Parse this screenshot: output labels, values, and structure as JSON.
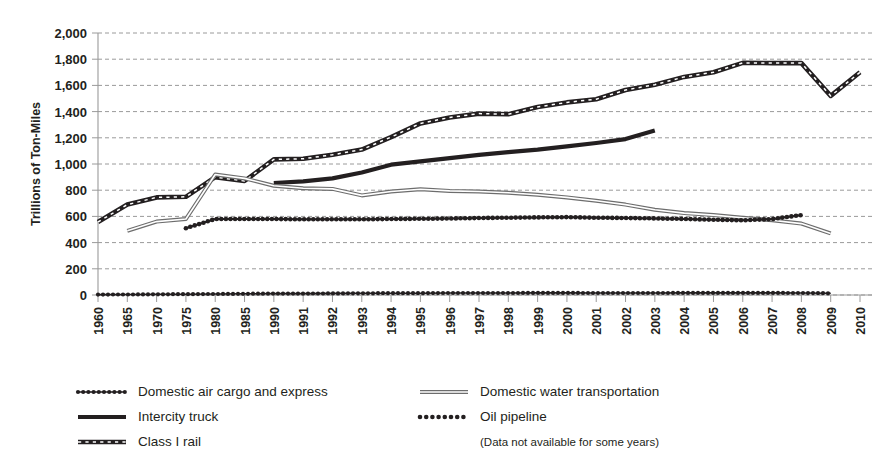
{
  "chart_data": {
    "type": "line",
    "title": "",
    "xlabel": "",
    "ylabel": "Trillions of Ton-Miles",
    "ylim": [
      0,
      2000
    ],
    "ytick_values": [
      0,
      200,
      400,
      600,
      800,
      1000,
      1200,
      1400,
      1600,
      1800,
      2000
    ],
    "ytick_labels": [
      "0",
      "200",
      "400",
      "600",
      "800",
      "1,000",
      "1,200",
      "1,400",
      "1,600",
      "1,800",
      "2,000"
    ],
    "grid": true,
    "legend_position": "below",
    "legend_note": "(Data not available for some years)",
    "categories": [
      "1960",
      "1965",
      "1970",
      "1975",
      "1980",
      "1985",
      "1990",
      "1991",
      "1992",
      "1993",
      "1994",
      "1995",
      "1996",
      "1997",
      "1998",
      "1999",
      "2000",
      "2001",
      "2002",
      "2003",
      "2004",
      "2005",
      "2006",
      "2007",
      "2008",
      "2009",
      "2010"
    ],
    "series": [
      {
        "name": "Domestic air cargo and express",
        "style": "dotted",
        "color": "#231f20",
        "values": [
          3,
          4,
          5,
          6,
          8,
          9,
          11,
          11,
          12,
          13,
          14,
          14,
          15,
          15,
          15,
          16,
          16,
          15,
          15,
          15,
          16,
          16,
          16,
          16,
          15,
          13,
          null
        ]
      },
      {
        "name": "Intercity truck",
        "style": "solid-thick",
        "color": "#231f20",
        "values": [
          null,
          null,
          null,
          null,
          null,
          null,
          855,
          868,
          890,
          935,
          995,
          1020,
          1045,
          1070,
          1090,
          1110,
          1135,
          1160,
          1190,
          1255,
          null,
          null,
          null,
          null,
          null,
          null,
          null
        ]
      },
      {
        "name": "Class I rail",
        "style": "dashed-marker",
        "color": "#231f20",
        "values": [
          557,
          690,
          745,
          750,
          900,
          870,
          1035,
          1040,
          1070,
          1110,
          1205,
          1310,
          1355,
          1385,
          1380,
          1435,
          1470,
          1495,
          1565,
          1605,
          1665,
          1700,
          1772,
          1770,
          1770,
          1520,
          1700
        ]
      },
      {
        "name": "Domestic water transportation",
        "style": "double-thin",
        "color": "#6d6d6d",
        "values": [
          null,
          490,
          560,
          580,
          920,
          890,
          834,
          815,
          810,
          760,
          790,
          808,
          795,
          790,
          780,
          765,
          745,
          720,
          690,
          650,
          625,
          610,
          590,
          570,
          545,
          470,
          null
        ]
      },
      {
        "name": "Oil pipeline",
        "style": "dotted-heavy",
        "color": "#231f20",
        "values": [
          null,
          null,
          null,
          510,
          580,
          580,
          580,
          578,
          578,
          578,
          580,
          582,
          584,
          588,
          590,
          592,
          595,
          590,
          588,
          585,
          580,
          575,
          570,
          580,
          610,
          null,
          null
        ]
      }
    ]
  },
  "legend": {
    "items": [
      {
        "label": "Domestic air cargo and express",
        "style": "dotted",
        "column": "left"
      },
      {
        "label": "Intercity truck",
        "style": "solid-thick",
        "column": "left"
      },
      {
        "label": "Class I rail",
        "style": "dashed-marker",
        "column": "left"
      },
      {
        "label": "Domestic water transportation",
        "style": "double-thin",
        "column": "right"
      },
      {
        "label": "Oil pipeline",
        "style": "dotted-heavy",
        "column": "right"
      }
    ],
    "note": "(Data not available for some years)"
  }
}
